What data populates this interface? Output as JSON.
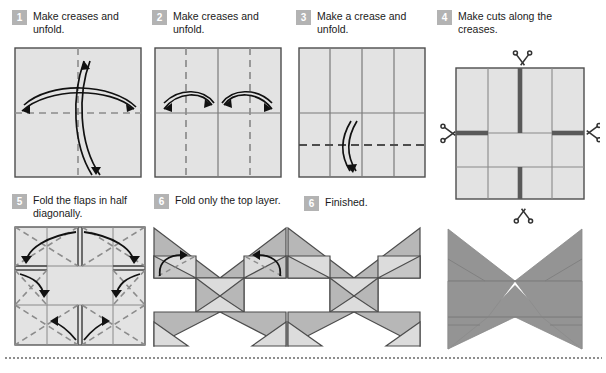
{
  "document": {
    "title": "Origami butterfly folding instructions",
    "type": "step-by-step diagram"
  },
  "colors": {
    "badge_bg": "#b3b3b3",
    "badge_text": "#ffffff",
    "heading_text": "#1a1a1a",
    "paper_light": "#e3e3e3",
    "paper_mid": "#c9c9c9",
    "paper_dark": "#a8a8a8",
    "photo_grey": "#949494",
    "outline": "#4d4d4d",
    "crease_dashed": "#8c8c8c",
    "crease_solid": "#7a7a7a",
    "cut_line": "#595959",
    "arrow": "#111111",
    "divider": "#8e8e8e"
  },
  "steps": [
    {
      "number": "1",
      "text": "Make creases and unfold.",
      "diagram": "square-with-dashed-center-creases-and-two-crossing-double-arrows",
      "creases": {
        "vertical_center": "dashed",
        "horizontal_center": "dashed"
      },
      "arrows": 2
    },
    {
      "number": "2",
      "text": "Make creases and unfold.",
      "diagram": "square-with-quarter-dashed-verticals-and-two-arrows",
      "creases": {
        "vertical_center": "solid",
        "horizontal_center": "solid",
        "vertical_quarters": "dashed"
      },
      "arrows": 2
    },
    {
      "number": "3",
      "text": "Make a crease and unfold.",
      "diagram": "square-with-three-solid-verticals-and-dashed-lower-horizontal",
      "creases": {
        "verticals": "solid",
        "horizontal_upper": "solid",
        "horizontal_lower": "dashed"
      },
      "arrows": 1
    },
    {
      "number": "4",
      "text": "Make cuts along the creases.",
      "diagram": "square-with-thick-cut-lines-and-four-scissors",
      "cut_lines": 4,
      "scissors": 4
    },
    {
      "number": "5",
      "text": "Fold the flaps in half diagonally.",
      "diagram": "cut-square-with-dashed-diagonals-and-six-fold-arrows",
      "arrows": 6
    },
    {
      "number": "6",
      "text": "Fold only the top layer.",
      "diagram": "butterfly-in-progress-with-two-arrows",
      "arrows": 2
    },
    {
      "number": "6",
      "text": "Finished.",
      "diagram": "finished-butterfly-line-drawing"
    }
  ],
  "photo": {
    "caption": "",
    "description": "finished grey paper butterfly"
  },
  "divider": {
    "style": "dotted"
  }
}
